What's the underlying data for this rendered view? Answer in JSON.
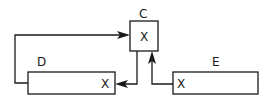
{
  "diagram": {
    "type": "block-connection",
    "nodes": [
      {
        "id": "C",
        "label": "C",
        "mark": "X"
      },
      {
        "id": "D",
        "label": "D",
        "mark": "X"
      },
      {
        "id": "E",
        "label": "E",
        "mark": "X"
      }
    ],
    "edges": [
      {
        "from": "D",
        "to": "C",
        "description": "D left side loops up and into C left side"
      },
      {
        "from": "C",
        "to": "D",
        "description": "C bottom down into D right side (X)"
      },
      {
        "from": "E",
        "to": "C",
        "description": "E left side (X) up into C bottom"
      }
    ]
  }
}
